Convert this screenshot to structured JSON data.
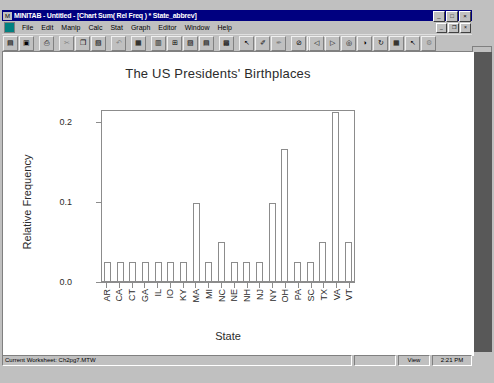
{
  "window": {
    "title": "MINITAB - Untitled - [Chart Sum( Rel Freq ) * State_abbrev]",
    "system_icon": "minitab-icon",
    "buttons": [
      {
        "name": "minimize-button",
        "glyph": "_"
      },
      {
        "name": "maximize-button",
        "glyph": "□"
      },
      {
        "name": "close-button",
        "glyph": "×"
      }
    ]
  },
  "menu": {
    "items": [
      {
        "label": "File"
      },
      {
        "label": "Edit"
      },
      {
        "label": "Manip"
      },
      {
        "label": "Calc"
      },
      {
        "label": "Stat"
      },
      {
        "label": "Graph"
      },
      {
        "label": "Editor"
      },
      {
        "label": "Window"
      },
      {
        "label": "Help"
      }
    ],
    "mdi_buttons": [
      {
        "name": "mdi-minimize-button",
        "glyph": "_"
      },
      {
        "name": "mdi-restore-button",
        "glyph": "❐"
      },
      {
        "name": "mdi-close-button",
        "glyph": "×"
      }
    ]
  },
  "toolbar": {
    "buttons": [
      {
        "name": "open-worksheet-button",
        "glyph": "▤"
      },
      {
        "name": "save-project-button",
        "glyph": "▣"
      },
      {
        "name": "separator",
        "glyph": ""
      },
      {
        "name": "print-button",
        "glyph": "⎙"
      },
      {
        "name": "separator",
        "glyph": ""
      },
      {
        "name": "cut-button",
        "glyph": "✂"
      },
      {
        "name": "copy-button",
        "glyph": "❐"
      },
      {
        "name": "paste-button",
        "glyph": "▧"
      },
      {
        "name": "separator",
        "glyph": ""
      },
      {
        "name": "undo-button",
        "glyph": "↶"
      },
      {
        "name": "separator",
        "glyph": ""
      },
      {
        "name": "find-button",
        "glyph": "▦"
      },
      {
        "name": "separator",
        "glyph": ""
      },
      {
        "name": "session-window-button",
        "glyph": "▥"
      },
      {
        "name": "data-window-button",
        "glyph": "⊞"
      },
      {
        "name": "history-window-button",
        "glyph": "▨"
      },
      {
        "name": "project-manager-button",
        "glyph": "▤"
      },
      {
        "name": "separator",
        "glyph": ""
      },
      {
        "name": "show-graphs-button",
        "glyph": "▩"
      },
      {
        "name": "separator",
        "glyph": ""
      },
      {
        "name": "select-arrow-button",
        "glyph": "↖"
      },
      {
        "name": "brush-button",
        "glyph": "✐"
      },
      {
        "name": "edit-tool-button",
        "glyph": "✒"
      },
      {
        "name": "separator",
        "glyph": ""
      },
      {
        "name": "cancel-button",
        "glyph": "⊘"
      },
      {
        "name": "annotate-button",
        "glyph": "↑"
      },
      {
        "name": "layout-button",
        "glyph": "▥"
      }
    ],
    "right_buttons": [
      {
        "name": "graph-zoom-out-button",
        "glyph": "◁"
      },
      {
        "name": "graph-zoom-in-button",
        "glyph": "▷"
      },
      {
        "name": "graph-pan-button",
        "glyph": "◎"
      },
      {
        "name": "graph-contrast-button",
        "glyph": "◑"
      },
      {
        "name": "graph-rotate-button",
        "glyph": "↻"
      },
      {
        "name": "graph-grid-button",
        "glyph": "▦"
      },
      {
        "name": "graph-pointer-button",
        "glyph": "↖"
      },
      {
        "name": "graph-settings-button",
        "glyph": "⚙"
      }
    ]
  },
  "statusbar": {
    "current_worksheet": "Current Worksheet: Ch2pg7.MTW",
    "blank_pane": "",
    "view_label": "View",
    "time": "2:21 PM"
  },
  "chart_data": {
    "type": "bar",
    "title": "The US Presidents' Birthplaces",
    "xlabel": "State",
    "ylabel": "Relative Frequency",
    "ylim": [
      0.0,
      0.215
    ],
    "ytick_labels": [
      "0.0",
      "0.1",
      "0.2"
    ],
    "ytick_values": [
      0.0,
      0.1,
      0.2
    ],
    "grid": false,
    "legend": "none",
    "categories": [
      "AR",
      "CA",
      "CT",
      "GA",
      "IL",
      "IO",
      "KY",
      "MA",
      "MI",
      "NC",
      "NE",
      "NH",
      "NJ",
      "NY",
      "OH",
      "PA",
      "SC",
      "TX",
      "VA",
      "VT"
    ],
    "values": [
      0.024,
      0.024,
      0.024,
      0.024,
      0.024,
      0.024,
      0.024,
      0.098,
      0.024,
      0.049,
      0.024,
      0.024,
      0.024,
      0.098,
      0.165,
      0.024,
      0.024,
      0.049,
      0.211,
      0.049
    ]
  }
}
